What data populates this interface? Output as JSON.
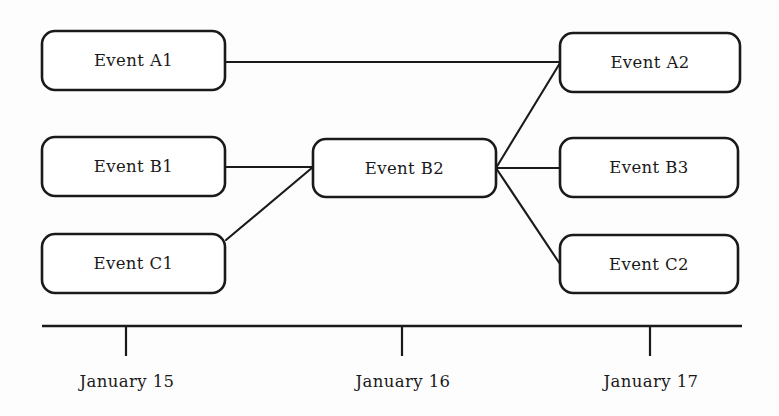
{
  "diagram": {
    "type": "event-timeline",
    "background_color": "#fdfdfd",
    "stroke_color": "#1a1a1a",
    "text_color": "#1a1a1a",
    "nodes": [
      {
        "id": "A1",
        "label": "Event A1",
        "x": 42,
        "y": 31,
        "w": 183,
        "h": 59
      },
      {
        "id": "A2",
        "label": "Event A2",
        "x": 560,
        "y": 33,
        "w": 180,
        "h": 59
      },
      {
        "id": "B1",
        "label": "Event B1",
        "x": 42,
        "y": 137,
        "w": 183,
        "h": 59
      },
      {
        "id": "B2",
        "label": "Event B2",
        "x": 313,
        "y": 139,
        "w": 183,
        "h": 58
      },
      {
        "id": "B3",
        "label": "Event B3",
        "x": 560,
        "y": 138,
        "w": 178,
        "h": 59
      },
      {
        "id": "C1",
        "label": "Event C1",
        "x": 42,
        "y": 234,
        "w": 183,
        "h": 59
      },
      {
        "id": "C2",
        "label": "Event C2",
        "x": 560,
        "y": 235,
        "w": 178,
        "h": 58
      }
    ],
    "edges": [
      {
        "from": "A1",
        "to": "A2",
        "x1": 225,
        "y1": 62,
        "x2": 560,
        "y2": 62
      },
      {
        "from": "B1",
        "to": "B2",
        "x1": 225,
        "y1": 167,
        "x2": 313,
        "y2": 167
      },
      {
        "from": "C1",
        "to": "B2",
        "x1": 226,
        "y1": 240,
        "x2": 313,
        "y2": 167
      },
      {
        "from": "B2",
        "to": "A2",
        "x1": 496,
        "y1": 168,
        "x2": 560,
        "y2": 63
      },
      {
        "from": "B2",
        "to": "B3",
        "x1": 496,
        "y1": 168,
        "x2": 560,
        "y2": 168
      },
      {
        "from": "B2",
        "to": "C2",
        "x1": 496,
        "y1": 168,
        "x2": 560,
        "y2": 264
      }
    ],
    "axis": {
      "x1": 42,
      "x2": 742,
      "y": 326,
      "tick_length": 30,
      "ticks": [
        {
          "label": "January 15",
          "x": 126
        },
        {
          "label": "January 16",
          "x": 402
        },
        {
          "label": "January 17",
          "x": 650
        }
      ],
      "label_y": 372
    }
  }
}
